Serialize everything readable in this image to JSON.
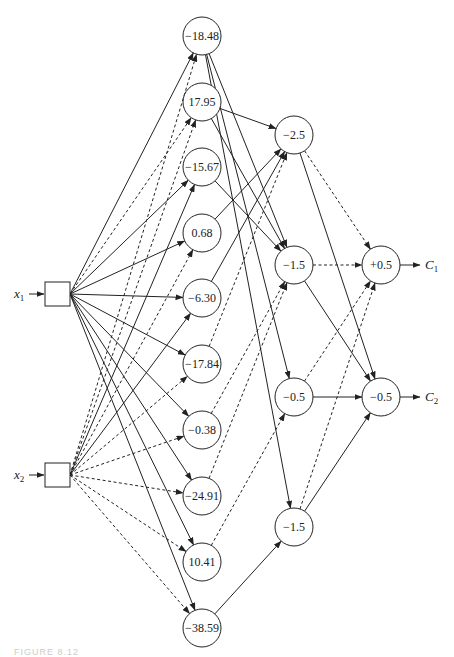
{
  "diagram": {
    "type": "feedforward neural network",
    "inputs": [
      {
        "id": "x1",
        "label": "x",
        "sub": "1"
      },
      {
        "id": "x2",
        "label": "x",
        "sub": "2"
      }
    ],
    "hidden_layer_1": [
      {
        "id": "h1_0",
        "label": "−18.48"
      },
      {
        "id": "h1_1",
        "label": "17.95"
      },
      {
        "id": "h1_2",
        "label": "−15.67"
      },
      {
        "id": "h1_3",
        "label": "0.68"
      },
      {
        "id": "h1_4",
        "label": "−6.30"
      },
      {
        "id": "h1_5",
        "label": "−17.84"
      },
      {
        "id": "h1_6",
        "label": "−0.38"
      },
      {
        "id": "h1_7",
        "label": "−24.91"
      },
      {
        "id": "h1_8",
        "label": "10.41"
      },
      {
        "id": "h1_9",
        "label": "−38.59"
      }
    ],
    "hidden_layer_2": [
      {
        "id": "h2_0",
        "label": "−2.5"
      },
      {
        "id": "h2_1",
        "label": "−1.5"
      },
      {
        "id": "h2_2",
        "label": "−0.5"
      },
      {
        "id": "h2_3",
        "label": "−1.5"
      }
    ],
    "output_layer": [
      {
        "id": "o_0",
        "label": "+0.5"
      },
      {
        "id": "o_1",
        "label": "−0.5"
      }
    ],
    "outputs": [
      {
        "id": "C1",
        "label": "C",
        "sub": "1"
      },
      {
        "id": "C2",
        "label": "C",
        "sub": "2"
      }
    ],
    "legend": {
      "solid_edge": "positive weight (solid line)",
      "dashed_edge": "negative weight (dashed line)"
    },
    "caption": "FIGURE 8.12"
  }
}
